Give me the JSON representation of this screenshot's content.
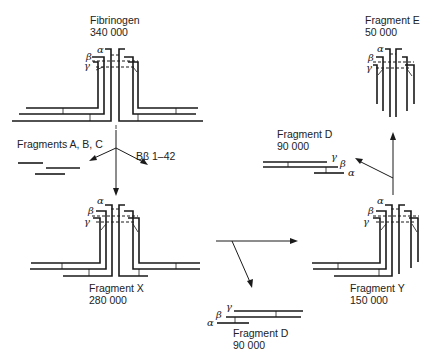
{
  "nodes": {
    "fibrinogen": {
      "name": "Fibrinogen",
      "mass": "340 000"
    },
    "fragment_x": {
      "name": "Fragment X",
      "mass": "280 000"
    },
    "fragment_y": {
      "name": "Fragment Y",
      "mass": "150 000"
    },
    "fragment_e": {
      "name": "Fragment E",
      "mass": "50 000"
    },
    "fragment_d_top": {
      "name": "Fragment D",
      "mass": "90 000"
    },
    "fragment_d_bottom": {
      "name": "Fragment D",
      "mass": "90 000"
    }
  },
  "side_products": {
    "fragments_abc": "Fragments A, B, C",
    "bbeta_peptide": "Bβ 1–42"
  },
  "chain_labels": {
    "alpha": "α",
    "beta": "β",
    "gamma": "γ"
  },
  "colors": {
    "line": "#1a1a1a",
    "background": "#ffffff"
  }
}
